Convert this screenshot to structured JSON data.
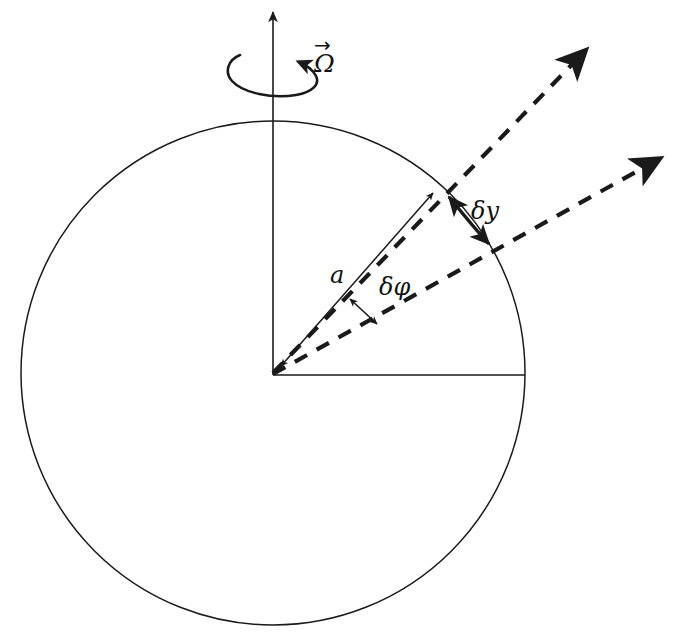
{
  "figure": {
    "background_color": "#ffffff",
    "stroke_color": "#1a1a1a",
    "width": 681,
    "height": 636
  },
  "labels": {
    "omega": "Ω",
    "omega_vector_arrow": "→",
    "radius": "a",
    "delta_phi": "δφ",
    "delta_y": "δy"
  },
  "icon_names": {
    "rotation_axis": "vertical-axis-arrow-icon",
    "spin_arc": "rotation-curved-arrow-icon",
    "radius_arrow": "double-headed-radius-arrow-icon",
    "dashed_ray_upper": "dashed-ray-arrow-icon",
    "dashed_ray_lower": "dashed-ray-arrow-icon",
    "delta_phi_arrow": "double-headed-gap-arrow-icon",
    "delta_y_arrow": "double-headed-arc-arrow-icon",
    "equator_line": "horizontal-radius-line-icon",
    "sphere_outline": "circle-outline-icon"
  },
  "geometry": {
    "circle": {
      "cx": 273,
      "cy": 373,
      "r": 252
    },
    "axis": {
      "x": 273,
      "y_top": 8,
      "y_bottom": 375
    },
    "equator": {
      "x1": 273,
      "y1": 375,
      "x2": 525,
      "y2": 375
    },
    "radius_arrow": {
      "x1": 277,
      "y1": 371,
      "x2": 437,
      "y2": 189
    },
    "dashed_upper": {
      "x1": 273,
      "y1": 373,
      "x2": 592,
      "y2": 44
    },
    "dashed_lower": {
      "x1": 273,
      "y1": 374,
      "x2": 666,
      "y2": 153
    },
    "delta_phi_gap": {
      "x1": 349,
      "y1": 296,
      "x2": 379,
      "y2": 327
    },
    "delta_y_arc": {
      "x1": 446,
      "y1": 194,
      "x2": 492,
      "y2": 247
    }
  },
  "label_positions": {
    "omega": {
      "x": 314,
      "y": 68
    },
    "radius": {
      "x": 337,
      "y": 277
    },
    "delta_phi": {
      "x": 382,
      "y": 288
    },
    "delta_y": {
      "x": 474,
      "y": 213
    }
  }
}
